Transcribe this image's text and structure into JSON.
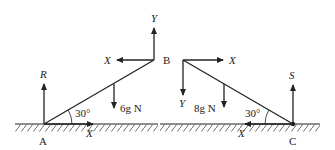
{
  "diagram": {
    "left": {
      "point_A": "A",
      "point_B": "B",
      "reaction_R": "R",
      "friction_X_ground": "X",
      "force_X_at_B": "X",
      "force_Y_at_B": "Y",
      "weight": "6g N",
      "angle": "30°"
    },
    "right": {
      "point_B": "B",
      "point_C": "C",
      "reaction_S": "S",
      "friction_X_ground": "X",
      "force_X_at_B": "X",
      "force_Y_at_B": "Y",
      "weight": "8g N",
      "angle": "30°"
    },
    "colors": {
      "ink": "#222222",
      "background": "#ffffff"
    }
  }
}
